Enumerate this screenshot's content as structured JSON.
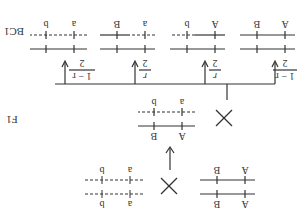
{
  "diagram": {
    "orientation": "rotated 180 degrees",
    "generations": {
      "parents": {
        "left": {
          "top_labels": [
            "A",
            "B"
          ],
          "bottom_labels": [
            "A",
            "B"
          ],
          "top_line": "solid",
          "bottom_line": "solid"
        },
        "cross_symbol": "×",
        "right": {
          "top_labels": [
            "a",
            "b"
          ],
          "bottom_labels": [
            "a",
            "b"
          ],
          "top_line": "dashed",
          "bottom_line": "dashed"
        }
      },
      "f1": {
        "label": "F1",
        "individual": {
          "top_labels": [
            "A",
            "B"
          ],
          "bottom_labels": [
            "a",
            "b"
          ],
          "top_line": "solid",
          "bottom_line": "dashed"
        },
        "cross_symbol": "×",
        "tester_labels": [
          "a",
          "b"
        ]
      },
      "bc1": {
        "label": "BC1",
        "offspring": [
          {
            "fraction_num": "1 − r",
            "fraction_den": "2",
            "top_labels": [
              "A",
              "B"
            ],
            "bottom_labels": [
              "A",
              "B"
            ],
            "top_line": "solid",
            "bottom_line": "solid"
          },
          {
            "fraction_num": "r",
            "fraction_den": "2",
            "top_labels": [
              "A",
              "B"
            ],
            "bottom_labels": [
              "A",
              "b"
            ],
            "top_line": "solid",
            "bottom_line": "mixed"
          },
          {
            "fraction_num": "r",
            "fraction_den": "2",
            "top_labels": [
              "A",
              "B"
            ],
            "bottom_labels": [
              "a",
              "B"
            ],
            "top_line": "solid",
            "bottom_line": "mixed"
          },
          {
            "fraction_num": "1 − r",
            "fraction_den": "2",
            "top_labels": [
              "A",
              "B"
            ],
            "bottom_labels": [
              "a",
              "b"
            ],
            "top_line": "solid",
            "bottom_line": "dashed"
          }
        ]
      }
    }
  }
}
